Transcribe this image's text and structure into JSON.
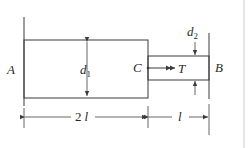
{
  "diagram": {
    "labels": {
      "support_left": "A",
      "support_right": "B",
      "step_point": "C",
      "torque": "T",
      "large_diameter": "d",
      "large_diameter_sub": "1",
      "small_diameter": "d",
      "small_diameter_sub": "2",
      "length_left_coef": "2",
      "length_left_var": "l",
      "length_right_var": "l"
    },
    "colors": {
      "line": "#3a3a3a",
      "text": "#2a2a2a",
      "border": "#e6e6e6"
    }
  }
}
